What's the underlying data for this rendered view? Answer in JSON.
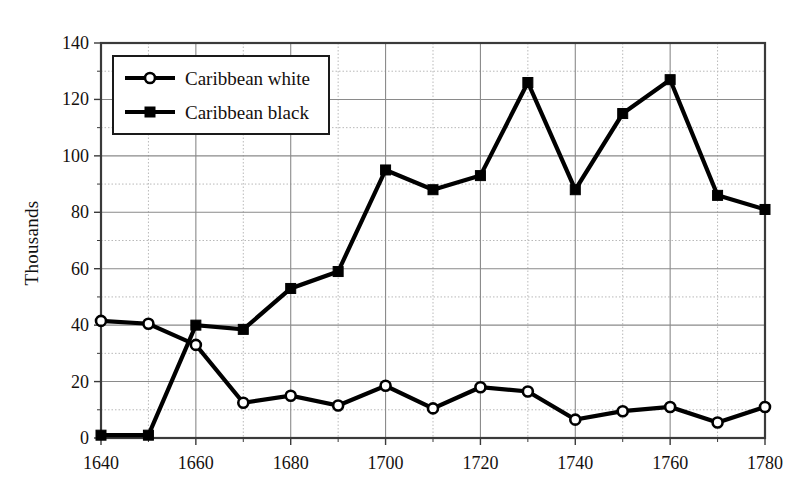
{
  "chart_data": {
    "type": "line",
    "title": "",
    "xlabel": "",
    "ylabel": "Thousands",
    "x": [
      1640,
      1650,
      1660,
      1670,
      1680,
      1690,
      1700,
      1710,
      1720,
      1730,
      1740,
      1750,
      1760,
      1770,
      1780
    ],
    "xlim": [
      1640,
      1780
    ],
    "ylim": [
      0,
      140
    ],
    "xticks": [
      1640,
      1660,
      1680,
      1700,
      1720,
      1740,
      1760,
      1780
    ],
    "xtick_labels": [
      "1640",
      "1660",
      "1680",
      "1700",
      "1720",
      "1740",
      "1760",
      "1780"
    ],
    "yticks": [
      0,
      20,
      40,
      60,
      80,
      100,
      120,
      140
    ],
    "ytick_labels": [
      "0",
      "20",
      "40",
      "60",
      "80",
      "100",
      "120",
      "140"
    ],
    "minor_yticks": [
      10,
      30,
      50,
      70,
      90,
      110,
      130
    ],
    "minor_xticks": [
      1650,
      1670,
      1690,
      1710,
      1730,
      1750,
      1770
    ],
    "grid": true,
    "legend_position": "upper left",
    "series": [
      {
        "name": "Caribbean white",
        "marker": "open-circle",
        "color": "#000000",
        "values": [
          41.5,
          40.5,
          33,
          12.5,
          15,
          11.5,
          18.5,
          10.5,
          18,
          16.5,
          6.5,
          9.5,
          11,
          5.5,
          11
        ]
      },
      {
        "name": "Caribbean black",
        "marker": "filled-square",
        "color": "#000000",
        "values": [
          1,
          1,
          40,
          38.5,
          53,
          59,
          95,
          88,
          93,
          126,
          88,
          115,
          127,
          86,
          81
        ]
      }
    ]
  },
  "legend": {
    "entries": [
      {
        "label": "Caribbean white",
        "marker": "open-circle"
      },
      {
        "label": "Caribbean black",
        "marker": "filled-square"
      }
    ]
  },
  "axes": {
    "y_axis_title": "Thousands"
  },
  "colors": {
    "line": "#000000",
    "grid_major": "#8a8a8a",
    "grid_minor": "#b9b9b9",
    "frame": "#3a3a3a",
    "background": "#ffffff"
  }
}
